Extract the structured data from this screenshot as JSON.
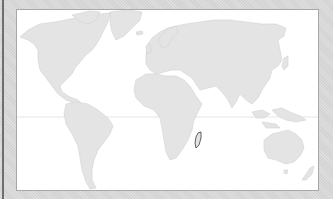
{
  "map": {
    "type": "world-map",
    "projection": "equirectangular",
    "highlighted_region": "Madagascar",
    "colors": {
      "background": "#d9d9d9",
      "panel": "#ffffff",
      "land": "#e4e4e4",
      "highlight_outline": "#3a3a3a",
      "equator_line": "#dedede"
    },
    "features": [
      "North America",
      "Greenland",
      "South America",
      "Europe",
      "Asia",
      "Africa",
      "Madagascar",
      "Australia",
      "Equator line"
    ]
  }
}
